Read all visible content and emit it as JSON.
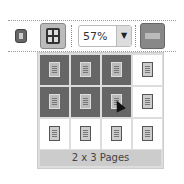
{
  "toolbar": {
    "single_page_button": {
      "icon": "single-page-icon"
    },
    "multi_page_button": {
      "icon": "grid-icon",
      "active": true
    },
    "zoom": {
      "value": "57%",
      "arrow": "▼"
    },
    "ruler_button": {
      "icon": "ruler-icon"
    }
  },
  "popup": {
    "columns": 4,
    "rows": 3,
    "selected_columns": 3,
    "selected_rows": 2,
    "caption": "2 x 3 Pages"
  }
}
